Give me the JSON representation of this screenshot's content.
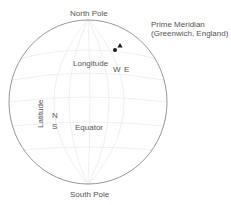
{
  "labels": {
    "north_pole": "North Pole",
    "south_pole": "South Pole",
    "prime_meridian_line1": "Prime Meridian",
    "prime_meridian_line2": "(Greenwich, England)",
    "longitude": "Longitude",
    "latitude": "Latitude",
    "equator": "Equator",
    "west": "W",
    "east": "E",
    "north": "N",
    "south": "S"
  },
  "colors": {
    "outline": "#8a8a8a",
    "grid": "#ebebeb",
    "text": "#555555",
    "marker": "#1a1a1a"
  }
}
